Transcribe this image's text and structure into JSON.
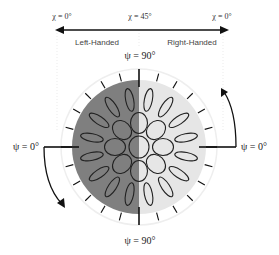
{
  "diagram": {
    "top_axis": {
      "chi_left": "χ = 0°",
      "chi_center": "χ = 45°",
      "chi_right": "χ = 0°",
      "left_region": "Left-Handed",
      "right_region": "Right-Handed"
    },
    "psi_labels": {
      "top": "ψ = 90°",
      "bottom": "ψ = 90°",
      "left": "ψ = 0°",
      "right": "ψ = 0°"
    },
    "colors": {
      "left_half": "#7f7f7f",
      "right_half": "#e6e6e6",
      "ellipse_stroke": "#222222",
      "outer_ring": "#eeeeee",
      "arrow": "#111111"
    },
    "geometry": {
      "center": [
        139,
        147
      ],
      "fill_radius": 67,
      "outer_ring_radius": 78,
      "inner_ring_count": 8,
      "outer_ring_count": 16,
      "tick_count": 24
    }
  }
}
